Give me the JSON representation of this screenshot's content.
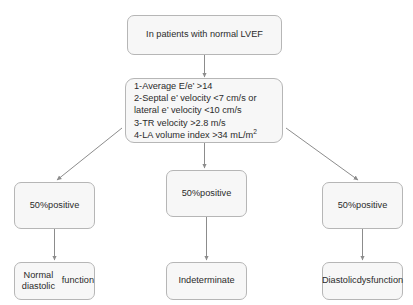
{
  "diagram": {
    "title_node": {
      "id": "root",
      "text": "In patients with normal LVEF"
    },
    "criteria_node": {
      "id": "criteria",
      "lines": [
        "1-Average E/e’ >14",
        "2-Septal e’ velocity <7 cm/s or",
        "lateral e’ velocity <10 cm/s",
        "3-TR velocity >2.8 m/s",
        "4-LA volume index >34 mL/m"
      ],
      "last_line_superscript": "2"
    },
    "middle_row": [
      {
        "id": "mid-left",
        "line1": "50%",
        "line2": "positive"
      },
      {
        "id": "mid-center",
        "line1": "50%",
        "line2": "positive"
      },
      {
        "id": "mid-right",
        "line1": "50%",
        "line2": "positive"
      }
    ],
    "outcome_row": [
      {
        "id": "out-left",
        "line1": "Normal diastolic",
        "line2": "function"
      },
      {
        "id": "out-center",
        "line1": "Indeterminate",
        "line2": ""
      },
      {
        "id": "out-right",
        "line1": "Diastolic",
        "line2": "dysfunction"
      }
    ],
    "colors": {
      "box_fill": "#f7f7f7",
      "box_border": "#b6b6b6",
      "connector": "#8c8c8c",
      "text": "#2b2b2b",
      "background": "#ffffff"
    }
  }
}
